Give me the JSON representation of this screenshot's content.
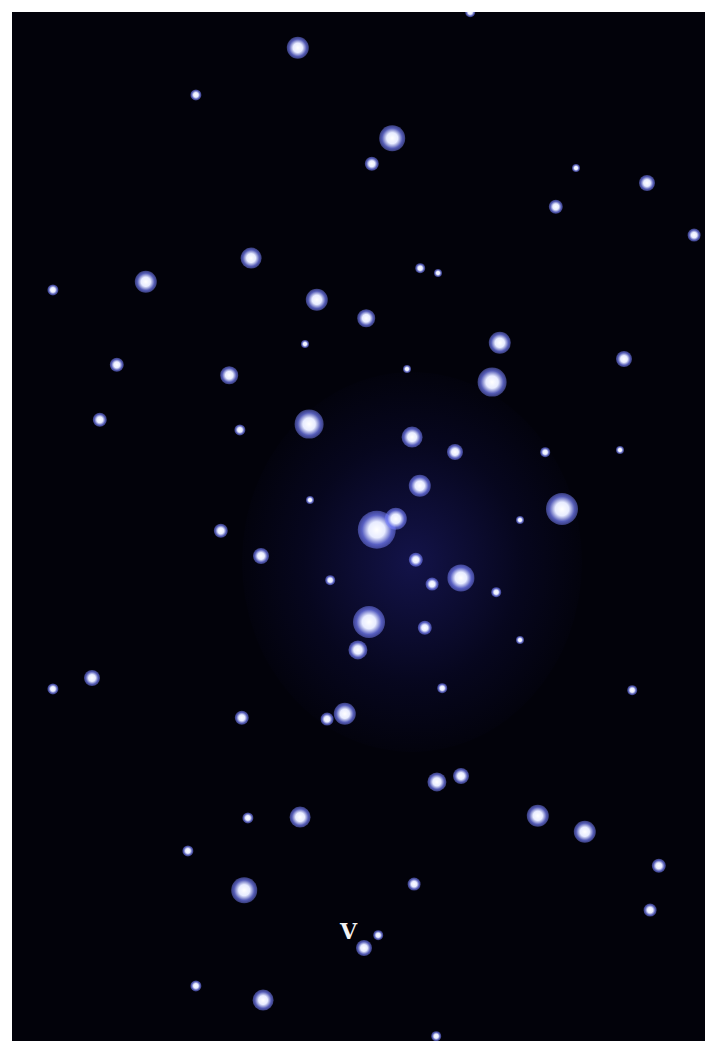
{
  "image": {
    "subject": "star cluster photograph",
    "label": "V",
    "label_pos": [
      340,
      932
    ],
    "colors": {
      "background": "#02020a",
      "star_core": "#ffffff",
      "star_halo": "#7882ff",
      "page": "#ffffff"
    }
  },
  "stars": [
    [
      298,
      48,
      14
    ],
    [
      470,
      12,
      6
    ],
    [
      196,
      95,
      7
    ],
    [
      392,
      138,
      16
    ],
    [
      372,
      164,
      9
    ],
    [
      647,
      183,
      10
    ],
    [
      556,
      207,
      9
    ],
    [
      694,
      235,
      8
    ],
    [
      251,
      258,
      13
    ],
    [
      146,
      282,
      14
    ],
    [
      53,
      290,
      7
    ],
    [
      317,
      300,
      14
    ],
    [
      366,
      318,
      11
    ],
    [
      500,
      343,
      14
    ],
    [
      624,
      359,
      10
    ],
    [
      117,
      365,
      9
    ],
    [
      229,
      375,
      11
    ],
    [
      492,
      382,
      18
    ],
    [
      100,
      420,
      9
    ],
    [
      309,
      424,
      18
    ],
    [
      412,
      437,
      13
    ],
    [
      455,
      452,
      10
    ],
    [
      562,
      509,
      20
    ],
    [
      420,
      486,
      14
    ],
    [
      377,
      530,
      24
    ],
    [
      396,
      519,
      14
    ],
    [
      221,
      531,
      9
    ],
    [
      261,
      556,
      10
    ],
    [
      416,
      560,
      9
    ],
    [
      461,
      578,
      17
    ],
    [
      432,
      584,
      8
    ],
    [
      369,
      622,
      20
    ],
    [
      425,
      628,
      9
    ],
    [
      358,
      650,
      12
    ],
    [
      53,
      689,
      7
    ],
    [
      92,
      678,
      10
    ],
    [
      242,
      718,
      9
    ],
    [
      345,
      714,
      14
    ],
    [
      327,
      719,
      8
    ],
    [
      437,
      782,
      12
    ],
    [
      461,
      776,
      10
    ],
    [
      300,
      817,
      13
    ],
    [
      248,
      818,
      7
    ],
    [
      538,
      816,
      14
    ],
    [
      585,
      832,
      14
    ],
    [
      188,
      851,
      7
    ],
    [
      659,
      866,
      9
    ],
    [
      650,
      910,
      8
    ],
    [
      244,
      890,
      16
    ],
    [
      414,
      884,
      8
    ],
    [
      364,
      948,
      10
    ],
    [
      378,
      935,
      6
    ],
    [
      196,
      986,
      7
    ],
    [
      263,
      1000,
      13
    ],
    [
      436,
      1036,
      6
    ],
    [
      632,
      690,
      6
    ],
    [
      576,
      168,
      5
    ],
    [
      420,
      268,
      6
    ],
    [
      438,
      273,
      5
    ],
    [
      305,
      344,
      5
    ],
    [
      407,
      369,
      5
    ],
    [
      240,
      430,
      7
    ],
    [
      545,
      452,
      6
    ],
    [
      620,
      450,
      5
    ],
    [
      496,
      592,
      6
    ],
    [
      330,
      580,
      6
    ],
    [
      442,
      688,
      6
    ],
    [
      520,
      520,
      5
    ],
    [
      310,
      500,
      5
    ],
    [
      520,
      640,
      5
    ]
  ]
}
